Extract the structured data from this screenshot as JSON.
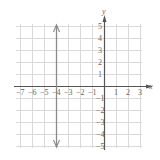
{
  "chart_data": {
    "type": "line",
    "title": "",
    "xlabel": "x",
    "ylabel": "y",
    "xlim": [
      -7,
      3
    ],
    "ylim": [
      -5,
      5
    ],
    "grid": true,
    "x_ticks": [
      "-7",
      "-6",
      "-5",
      "-4",
      "-3",
      "-2",
      "-1",
      "1",
      "2",
      "3"
    ],
    "y_ticks": [
      "5",
      "4",
      "3",
      "2",
      "1",
      "-1",
      "-2",
      "-3",
      "-4",
      "-5"
    ],
    "series": [
      {
        "name": "x = -4",
        "points": [
          [
            -4,
            -5
          ],
          [
            -4,
            5
          ]
        ],
        "arrows": "both"
      }
    ]
  },
  "axis": {
    "x_label": "x",
    "y_label": "y"
  },
  "colors": {
    "grid": "#d9d9d9",
    "axis": "#555555",
    "line": "#8a8a8a",
    "text": "#666666"
  }
}
